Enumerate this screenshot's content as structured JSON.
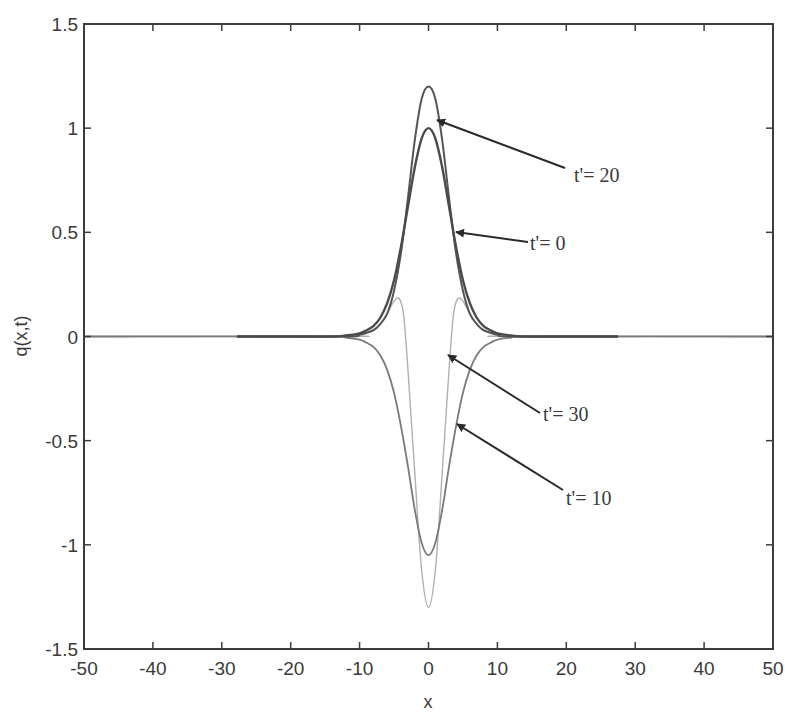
{
  "chart_data": {
    "type": "line",
    "title": "",
    "xlabel": "x",
    "ylabel": "q(x,t)",
    "xlim": [
      -50,
      50
    ],
    "ylim": [
      -1.5,
      1.5
    ],
    "grid": false,
    "legend": null,
    "xticks": [
      -50,
      -40,
      -30,
      -20,
      -10,
      0,
      10,
      20,
      30,
      40,
      50
    ],
    "xtick_labels": [
      "-50",
      "-40",
      "-30",
      "-20",
      "-10",
      "0",
      "10",
      "20",
      "30",
      "40",
      "50"
    ],
    "yticks": [
      -1.5,
      -1,
      -0.5,
      0,
      0.5,
      1,
      1.5
    ],
    "ytick_labels": [
      "-1.5",
      "-1",
      "-0.5",
      "0",
      "0.5",
      "1",
      "1.5"
    ],
    "series": [
      {
        "name": "t'=0",
        "color": "#4a4a4a",
        "width": 2.4,
        "x": [
          -27.8,
          -15,
          -12,
          -10,
          -9,
          -8,
          -7,
          -6,
          -5,
          -4,
          -3,
          -2,
          -1,
          0,
          1,
          2,
          3,
          4,
          5,
          6,
          7,
          8,
          9,
          10,
          12,
          15,
          27.5
        ],
        "y": [
          0.0,
          0.0,
          0.005,
          0.015,
          0.03,
          0.05,
          0.09,
          0.16,
          0.27,
          0.43,
          0.62,
          0.81,
          0.95,
          1.0,
          0.95,
          0.81,
          0.62,
          0.43,
          0.27,
          0.16,
          0.09,
          0.05,
          0.03,
          0.015,
          0.005,
          0.0,
          0.0
        ]
      },
      {
        "name": "t'=20",
        "color": "#555555",
        "width": 2.0,
        "x": [
          -27.8,
          -12,
          -10,
          -8,
          -7,
          -6,
          -5,
          -4,
          -3,
          -2,
          -1,
          0,
          1,
          2,
          3,
          4,
          5,
          6,
          7,
          8,
          10,
          12,
          27.5
        ],
        "y": [
          0.0,
          0.0,
          0.01,
          0.03,
          0.06,
          0.11,
          0.22,
          0.4,
          0.66,
          0.94,
          1.14,
          1.2,
          1.14,
          0.94,
          0.66,
          0.4,
          0.22,
          0.11,
          0.06,
          0.03,
          0.01,
          0.0,
          0.0
        ]
      },
      {
        "name": "t'=10",
        "color": "#7a7a7a",
        "width": 1.8,
        "x": [
          -50,
          -15,
          -12,
          -10,
          -9,
          -8,
          -7,
          -6,
          -5,
          -4,
          -3,
          -2,
          -1,
          0,
          1,
          2,
          3,
          4,
          5,
          6,
          7,
          8,
          9,
          10,
          12,
          15,
          50
        ],
        "y": [
          0.0,
          0.0,
          -0.005,
          -0.015,
          -0.03,
          -0.05,
          -0.09,
          -0.16,
          -0.27,
          -0.43,
          -0.62,
          -0.83,
          -0.99,
          -1.05,
          -0.99,
          -0.83,
          -0.62,
          -0.43,
          -0.27,
          -0.16,
          -0.09,
          -0.05,
          -0.03,
          -0.015,
          -0.005,
          0.0,
          0.0
        ]
      },
      {
        "name": "t'=30",
        "color": "#b0b0b0",
        "width": 1.4,
        "x": [
          -50,
          -12,
          -10,
          -8,
          -7,
          -6,
          -5,
          -4.2,
          -3.6,
          -3,
          -2,
          -1,
          0,
          1,
          2,
          3,
          3.6,
          4.2,
          5,
          6,
          7,
          8,
          10,
          12,
          50
        ],
        "y": [
          0.0,
          0.0,
          0.005,
          0.03,
          0.06,
          0.11,
          0.17,
          0.18,
          0.1,
          -0.15,
          -0.65,
          -1.12,
          -1.3,
          -1.12,
          -0.65,
          -0.15,
          0.1,
          0.18,
          0.17,
          0.11,
          0.06,
          0.03,
          0.005,
          0.0,
          0.0
        ]
      }
    ],
    "annotations": [
      {
        "text": "t'= 20",
        "text_pos": [
          574,
          182
        ],
        "arrow_from": [
          565,
          168
        ],
        "arrow_to": [
          437,
          120
        ]
      },
      {
        "text": "t'= 0",
        "text_pos": [
          530,
          250
        ],
        "arrow_from": [
          528,
          242
        ],
        "arrow_to": [
          456,
          232
        ]
      },
      {
        "text": "t'= 30",
        "text_pos": [
          543,
          421
        ],
        "arrow_from": [
          540,
          413
        ],
        "arrow_to": [
          448,
          355
        ]
      },
      {
        "text": "t'= 10",
        "text_pos": [
          566,
          505
        ],
        "arrow_from": [
          563,
          490
        ],
        "arrow_to": [
          457,
          424
        ]
      }
    ]
  }
}
